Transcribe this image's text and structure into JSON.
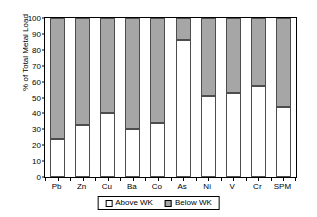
{
  "chart_data": {
    "type": "bar",
    "subtype": "stacked-percent",
    "title": "",
    "xlabel": "",
    "ylabel": "% of Total Metal Load",
    "ylim": [
      0,
      100
    ],
    "yticks": [
      0,
      10,
      20,
      30,
      40,
      50,
      60,
      70,
      80,
      90,
      100
    ],
    "grid": false,
    "legend_position": "bottom",
    "categories": [
      "Pb",
      "Zn",
      "Cu",
      "Ba",
      "Co",
      "As",
      "Ni",
      "V",
      "Cr",
      "SPM"
    ],
    "series": [
      {
        "name": "Above WK",
        "color": "#ffffff",
        "values": [
          24,
          33,
          40,
          30,
          34,
          86,
          51,
          53,
          57,
          44
        ]
      },
      {
        "name": "Below WK",
        "color": "#a6a6a6",
        "values": [
          76,
          67,
          60,
          70,
          66,
          14,
          49,
          47,
          43,
          56
        ]
      }
    ]
  },
  "legend": {
    "items": [
      {
        "label": "Above WK",
        "swatch": "white-swatch"
      },
      {
        "label": "Below WK",
        "swatch": "gray-swatch"
      }
    ]
  },
  "axes": {
    "y_title": "% of Total Metal Load",
    "y_tick_labels": [
      "0",
      "10",
      "20",
      "30",
      "40",
      "50",
      "60",
      "70",
      "80",
      "90",
      "100"
    ],
    "x_tick_labels": [
      "Pb",
      "Zn",
      "Cu",
      "Ba",
      "Co",
      "As",
      "Ni",
      "V",
      "Cr",
      "SPM"
    ]
  }
}
